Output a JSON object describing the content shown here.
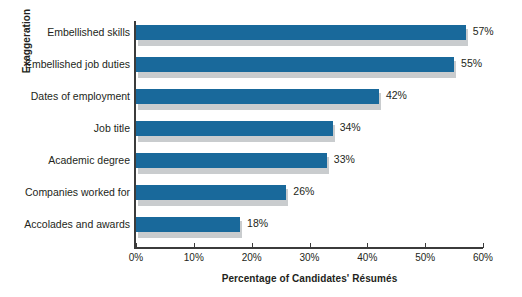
{
  "chart_data": {
    "type": "bar",
    "orientation": "horizontal",
    "title": "",
    "xlabel": "Percentage of Candidates' Résumés",
    "ylabel": "Exaggeration",
    "categories": [
      "Embellished skills",
      "Embellished job duties",
      "Dates of employment",
      "Job title",
      "Academic degree",
      "Companies worked for",
      "Accolades and awards"
    ],
    "values": [
      57,
      55,
      42,
      34,
      33,
      26,
      18
    ],
    "value_labels": [
      "57%",
      "55%",
      "42%",
      "34%",
      "33%",
      "26%",
      "18%"
    ],
    "xlim": [
      0,
      60
    ],
    "xticks": [
      0,
      10,
      20,
      30,
      40,
      50,
      60
    ],
    "xtick_labels": [
      "0%",
      "10%",
      "20%",
      "30%",
      "40%",
      "50%",
      "60%"
    ],
    "grid": false,
    "legend": "none",
    "bar_color": "#19699b",
    "bar_shadow_color": "#c9ccce",
    "axis_color": "#3b3b3b",
    "text_color": "#231f20",
    "background": "#ffffff"
  }
}
